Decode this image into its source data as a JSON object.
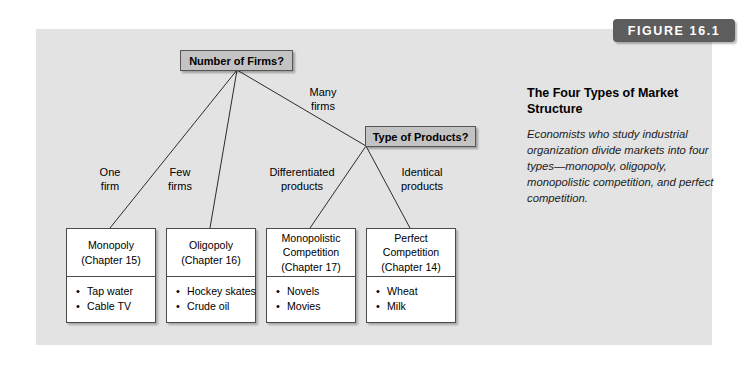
{
  "figure": {
    "banner_label": "FIGURE 16.1",
    "caption_title": "The Four Types of Market Structure",
    "caption_body": "Economists who study industrial organization divide markets into four types—monopoly, oligopoly, monopolistic competition, and perfect competition."
  },
  "colors": {
    "panel_background": "#e3e3e3",
    "banner_background": "#5d5d5d",
    "banner_text": "#ffffff",
    "decision_node_fill": "#c3c3c3",
    "decision_node_border": "#555555",
    "outcome_box_fill": "#ffffff",
    "outcome_box_border": "#4a4a4a",
    "connector_line": "#2b2b2b",
    "page_background": "#ffffff"
  },
  "diagram": {
    "decision_nodes": [
      {
        "id": "number-of-firms",
        "label": "Number of Firms?"
      },
      {
        "id": "type-of-products",
        "label": "Type of Products?"
      }
    ],
    "edge_labels": [
      {
        "id": "one-firm",
        "line1": "One",
        "line2": "firm"
      },
      {
        "id": "few-firms",
        "line1": "Few",
        "line2": "firms"
      },
      {
        "id": "many-firms",
        "line1": "Many",
        "line2": "firms"
      },
      {
        "id": "differentiated-products",
        "line1": "Differentiated",
        "line2": "products"
      },
      {
        "id": "identical-products",
        "line1": "Identical",
        "line2": "products"
      }
    ],
    "outcomes": [
      {
        "id": "monopoly",
        "name": "Monopoly",
        "chapter": "(Chapter 15)",
        "examples": [
          "Tap water",
          "Cable TV"
        ]
      },
      {
        "id": "oligopoly",
        "name": "Oligopoly",
        "chapter": "(Chapter 16)",
        "examples": [
          "Hockey skates",
          "Crude oil"
        ]
      },
      {
        "id": "monopolistic-competition",
        "name": "Monopolistic Competition",
        "chapter": "(Chapter 17)",
        "examples": [
          "Novels",
          "Movies"
        ]
      },
      {
        "id": "perfect-competition",
        "name": "Perfect Competition",
        "chapter": "(Chapter 14)",
        "examples": [
          "Wheat",
          "Milk"
        ]
      }
    ]
  }
}
